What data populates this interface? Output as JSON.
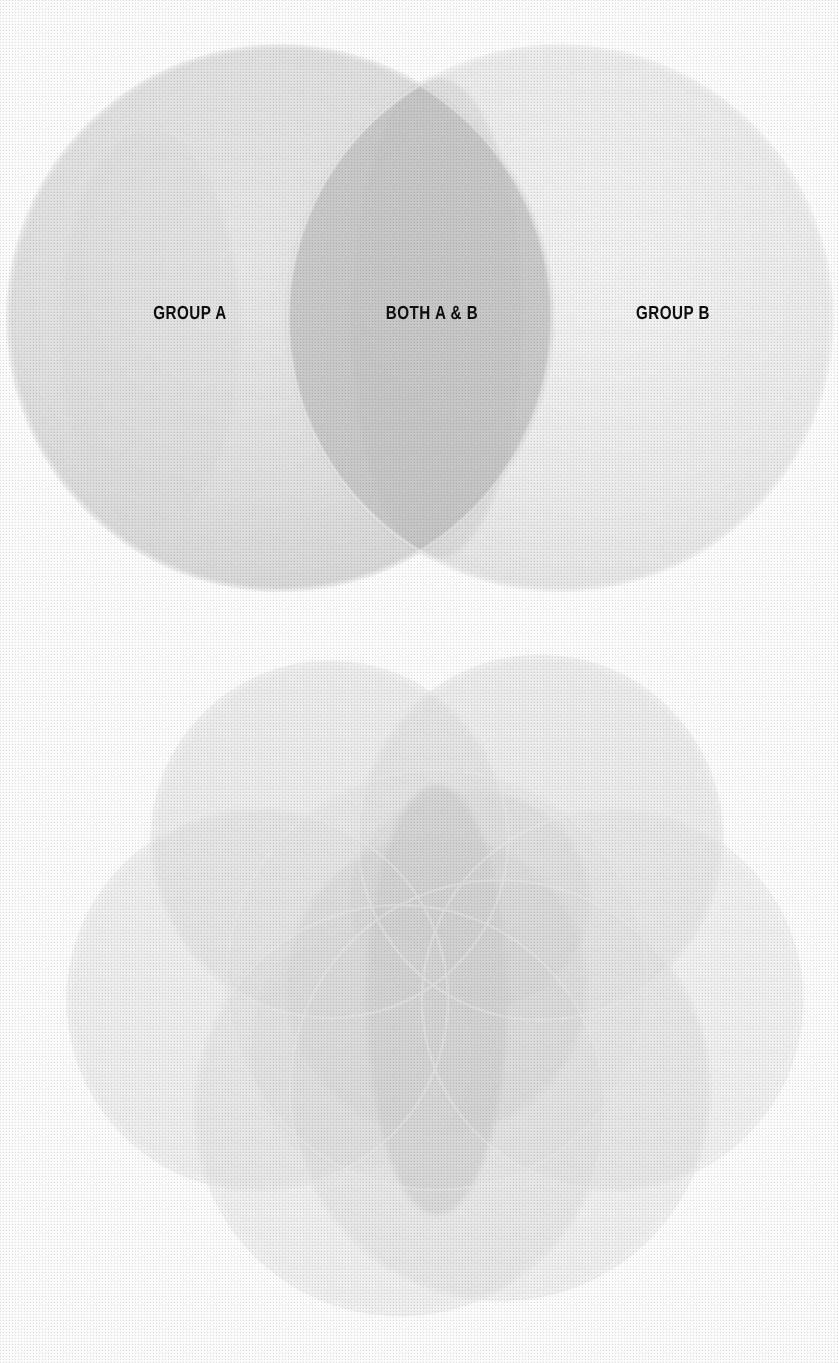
{
  "page": {
    "width": 838,
    "height": 1363,
    "background_color": "#ffffff",
    "media": "scanned halftone print, grayscale"
  },
  "figures": [
    {
      "id": "two-set-venn",
      "name": "Two-circle Venn diagram",
      "labels": [
        {
          "id": "group-a",
          "text": "GROUP A",
          "x": 190,
          "y": 313
        },
        {
          "id": "both-a-b",
          "text": "BOTH A & B",
          "x": 432,
          "y": 313
        },
        {
          "id": "group-b",
          "text": "GROUP B",
          "x": 673,
          "y": 313
        }
      ]
    },
    {
      "id": "multi-set-venn",
      "name": "Multi-circle Venn diagram",
      "labels": []
    }
  ],
  "chart_data": [
    {
      "type": "venn",
      "id": "two-set-venn",
      "title": "",
      "sets": [
        "GROUP A",
        "GROUP B"
      ],
      "region_labels": [
        "GROUP A",
        "BOTH A & B",
        "GROUP B"
      ],
      "circles": [
        {
          "set": "GROUP A",
          "cx": 280,
          "cy": 318,
          "r": 272,
          "fill": "#e3e3e3",
          "opacity": 0.55
        },
        {
          "set": "GROUP B",
          "cx": 560,
          "cy": 318,
          "r": 272,
          "fill": "#e3e3e3",
          "opacity": 0.42
        }
      ],
      "intersection_fill": "#c4c4c4",
      "grid": false,
      "legend": "none"
    },
    {
      "type": "venn",
      "id": "multi-set-venn",
      "title": "",
      "sets": [
        "S1",
        "S2",
        "S3",
        "S4",
        "S5",
        "S6",
        "S7"
      ],
      "region_labels": [],
      "circles": [
        {
          "set": "S1",
          "cx": 330,
          "cy": 840,
          "r": 178,
          "fill": "#dcdcdc",
          "opacity": 0.4
        },
        {
          "set": "S2",
          "cx": 540,
          "cy": 838,
          "r": 182,
          "fill": "#dcdcdc",
          "opacity": 0.4
        },
        {
          "set": "S3",
          "cx": 258,
          "cy": 1000,
          "r": 190,
          "fill": "#dcdcdc",
          "opacity": 0.36
        },
        {
          "set": "S4",
          "cx": 612,
          "cy": 1000,
          "r": 190,
          "fill": "#dcdcdc",
          "opacity": 0.34
        },
        {
          "set": "S5",
          "cx": 400,
          "cy": 1110,
          "r": 205,
          "fill": "#dcdcdc",
          "opacity": 0.34
        },
        {
          "set": "S6",
          "cx": 500,
          "cy": 1090,
          "r": 210,
          "fill": "#dcdcdc",
          "opacity": 0.34
        },
        {
          "set": "S7",
          "cx": 437,
          "cy": 980,
          "r": 210,
          "fill": "#dcdcdc",
          "opacity": 0.3
        }
      ],
      "darkest_region": {
        "cx": 437,
        "cy": 1000,
        "note": "central all-set overlap"
      },
      "grid": false,
      "legend": "none"
    }
  ],
  "colors": {
    "paper": "#ffffff",
    "ink_light": "#e4e4e4",
    "ink_mid": "#cccccc",
    "ink_dark": "#b0b0b0",
    "text": "#0d0d0d"
  }
}
